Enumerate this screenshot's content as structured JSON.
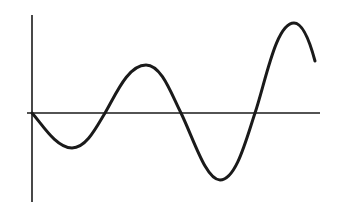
{
  "diagram": {
    "type": "oscillating-wave",
    "colors": {
      "background": "#ffffff",
      "stroke": "#1a1a1a"
    },
    "axes": {
      "vertical": {
        "x": 32,
        "y1": 15,
        "y2": 202
      },
      "horizontal": {
        "y": 113,
        "x1": 27,
        "x2": 320
      }
    },
    "curve_points": [
      [
        32,
        113
      ],
      [
        72,
        148
      ],
      [
        105,
        113
      ],
      [
        146,
        65
      ],
      [
        181,
        113
      ],
      [
        220,
        180
      ],
      [
        255,
        113
      ],
      [
        294,
        23
      ],
      [
        315,
        61
      ]
    ]
  }
}
